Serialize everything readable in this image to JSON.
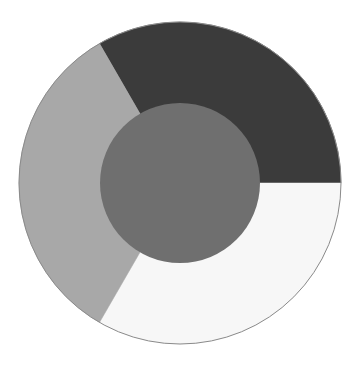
{
  "diagram": {
    "type": "ring-with-center",
    "center": {
      "x": 180,
      "y": 183
    },
    "outer_radius": 161,
    "inner_radius": 80,
    "outline_color": "#8a8a8a",
    "segments": [
      {
        "name": "dark-segment",
        "start_deg": -120,
        "end_deg": 0,
        "color": "#3b3b3b"
      },
      {
        "name": "white-segment",
        "start_deg": 0,
        "end_deg": 120,
        "color": "#f7f7f7"
      },
      {
        "name": "light-gray-segment",
        "start_deg": 120,
        "end_deg": 240,
        "color": "#a8a8a8"
      }
    ],
    "center_circle": {
      "color": "#6f6f6f"
    }
  },
  "chart_data": {
    "type": "pie",
    "title": "",
    "categories": [
      "dark",
      "white",
      "light gray"
    ],
    "values": [
      33.3,
      33.3,
      33.3
    ],
    "colors": [
      "#3b3b3b",
      "#f7f7f7",
      "#a8a8a8"
    ],
    "center_circle_color": "#6f6f6f",
    "legend": "none"
  }
}
